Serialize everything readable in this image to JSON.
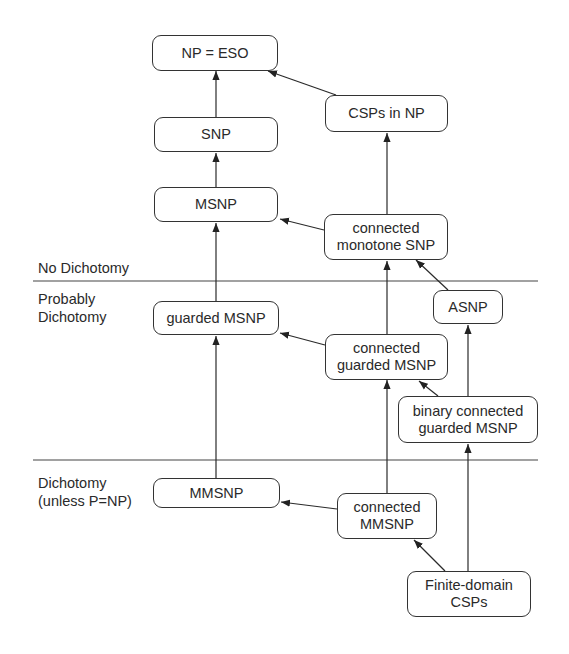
{
  "diagram": {
    "zones": [
      {
        "label_lines": [
          "No Dichotomy"
        ]
      },
      {
        "label_lines": [
          "Probably",
          "Dichotomy"
        ]
      },
      {
        "label_lines": [
          "Dichotomy",
          "(unless P=NP)"
        ]
      }
    ],
    "nodes": {
      "np_eso": {
        "lines": [
          "NP = ESO"
        ]
      },
      "csps_in_np": {
        "lines": [
          "CSPs in NP"
        ]
      },
      "snp": {
        "lines": [
          "SNP"
        ]
      },
      "msnp": {
        "lines": [
          "MSNP"
        ]
      },
      "connected_monotone_snp": {
        "lines": [
          "connected",
          "monotone SNP"
        ]
      },
      "guarded_msnp": {
        "lines": [
          "guarded MSNP"
        ]
      },
      "asnp": {
        "lines": [
          "ASNP"
        ]
      },
      "connected_guarded_msnp": {
        "lines": [
          "connected",
          "guarded MSNP"
        ]
      },
      "binary_connected_guarded_msnp": {
        "lines": [
          "binary connected",
          "guarded MSNP"
        ]
      },
      "mmsnp": {
        "lines": [
          "MMSNP"
        ]
      },
      "connected_mmsnp": {
        "lines": [
          "connected",
          "MMSNP"
        ]
      },
      "finite_domain_csps": {
        "lines": [
          "Finite-domain",
          "CSPs"
        ]
      }
    },
    "edges": [
      {
        "from": "snp",
        "to": "np_eso"
      },
      {
        "from": "csps_in_np",
        "to": "np_eso"
      },
      {
        "from": "msnp",
        "to": "snp"
      },
      {
        "from": "connected_monotone_snp",
        "to": "csps_in_np"
      },
      {
        "from": "connected_monotone_snp",
        "to": "msnp"
      },
      {
        "from": "guarded_msnp",
        "to": "msnp"
      },
      {
        "from": "connected_guarded_msnp",
        "to": "connected_monotone_snp"
      },
      {
        "from": "asnp",
        "to": "connected_monotone_snp"
      },
      {
        "from": "connected_guarded_msnp",
        "to": "guarded_msnp"
      },
      {
        "from": "binary_connected_guarded_msnp",
        "to": "connected_guarded_msnp"
      },
      {
        "from": "binary_connected_guarded_msnp",
        "to": "asnp"
      },
      {
        "from": "mmsnp",
        "to": "guarded_msnp"
      },
      {
        "from": "connected_mmsnp",
        "to": "connected_guarded_msnp"
      },
      {
        "from": "connected_mmsnp",
        "to": "mmsnp"
      },
      {
        "from": "finite_domain_csps",
        "to": "connected_mmsnp"
      },
      {
        "from": "finite_domain_csps",
        "to": "binary_connected_guarded_msnp"
      }
    ],
    "colors": {
      "stroke": "#333333",
      "text": "#2a2a2a",
      "background": "#ffffff"
    }
  }
}
